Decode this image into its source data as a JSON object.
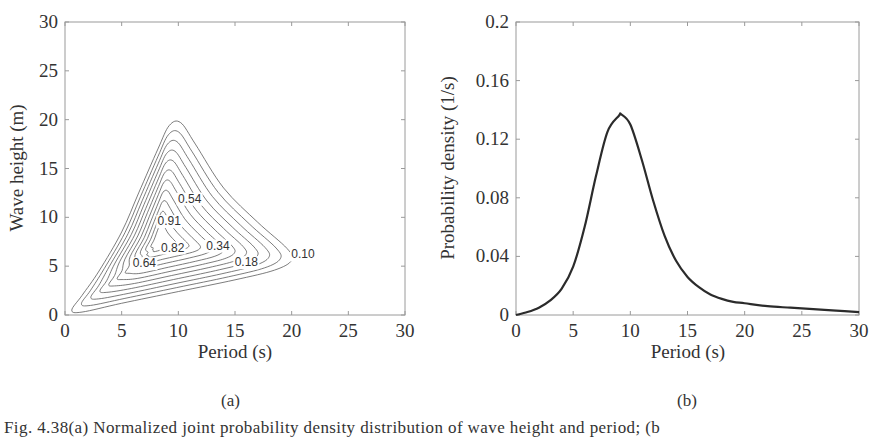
{
  "figure": {
    "panel_a_label": "(a)",
    "panel_b_label": "(b)",
    "caption_fragment": "Fig. 4.38(a) Normalized joint probability density distribution of wave height and period; (b"
  },
  "chart_data": [
    {
      "type": "contour",
      "panel": "(a)",
      "title": "",
      "xlabel": "Period (s)",
      "ylabel": "Wave height (m)",
      "xlim": [
        0,
        30
      ],
      "ylim": [
        0,
        30
      ],
      "xticks": [
        "0",
        "5",
        "10",
        "15",
        "20",
        "25",
        "30"
      ],
      "yticks": [
        "0",
        "5",
        "10",
        "15",
        "20",
        "25",
        "30"
      ],
      "grid": false,
      "peak": {
        "period": 8.3,
        "wave_height": 7.5
      },
      "contour_labels": [
        {
          "text": "0.54",
          "x": 11.0,
          "y": 11.5
        },
        {
          "text": "0.91",
          "x": 9.2,
          "y": 9.2
        },
        {
          "text": "0.82",
          "x": 9.5,
          "y": 6.5
        },
        {
          "text": "0.34",
          "x": 13.5,
          "y": 6.7
        },
        {
          "text": "0.64",
          "x": 7.0,
          "y": 4.9
        },
        {
          "text": "0.18",
          "x": 16.0,
          "y": 5.0
        },
        {
          "text": "0.10",
          "x": 21.0,
          "y": 5.8
        }
      ],
      "outer_contour_extent": {
        "period_max": 20.0,
        "height_max": 19.7
      }
    },
    {
      "type": "line",
      "panel": "(b)",
      "title": "",
      "xlabel": "Period (s)",
      "ylabel": "Probability density (1/s)",
      "xlim": [
        0,
        30
      ],
      "ylim": [
        0,
        0.2
      ],
      "xticks": [
        "0",
        "5",
        "10",
        "15",
        "20",
        "25",
        "30"
      ],
      "yticks": [
        "0",
        "0.04",
        "0.08",
        "0.12",
        "0.16",
        "0.2"
      ],
      "grid": false,
      "series": [
        {
          "name": "marginal period density",
          "x": [
            0,
            1,
            2,
            3,
            4,
            5,
            6,
            7,
            8,
            9,
            9.2,
            10,
            11,
            12,
            13,
            14,
            15,
            16,
            17,
            18,
            19,
            20,
            22,
            24,
            26,
            28,
            30
          ],
          "values": [
            0.0,
            0.002,
            0.005,
            0.01,
            0.018,
            0.033,
            0.06,
            0.095,
            0.125,
            0.136,
            0.137,
            0.13,
            0.106,
            0.078,
            0.054,
            0.037,
            0.026,
            0.019,
            0.014,
            0.011,
            0.009,
            0.008,
            0.006,
            0.005,
            0.004,
            0.003,
            0.002
          ]
        }
      ]
    }
  ]
}
